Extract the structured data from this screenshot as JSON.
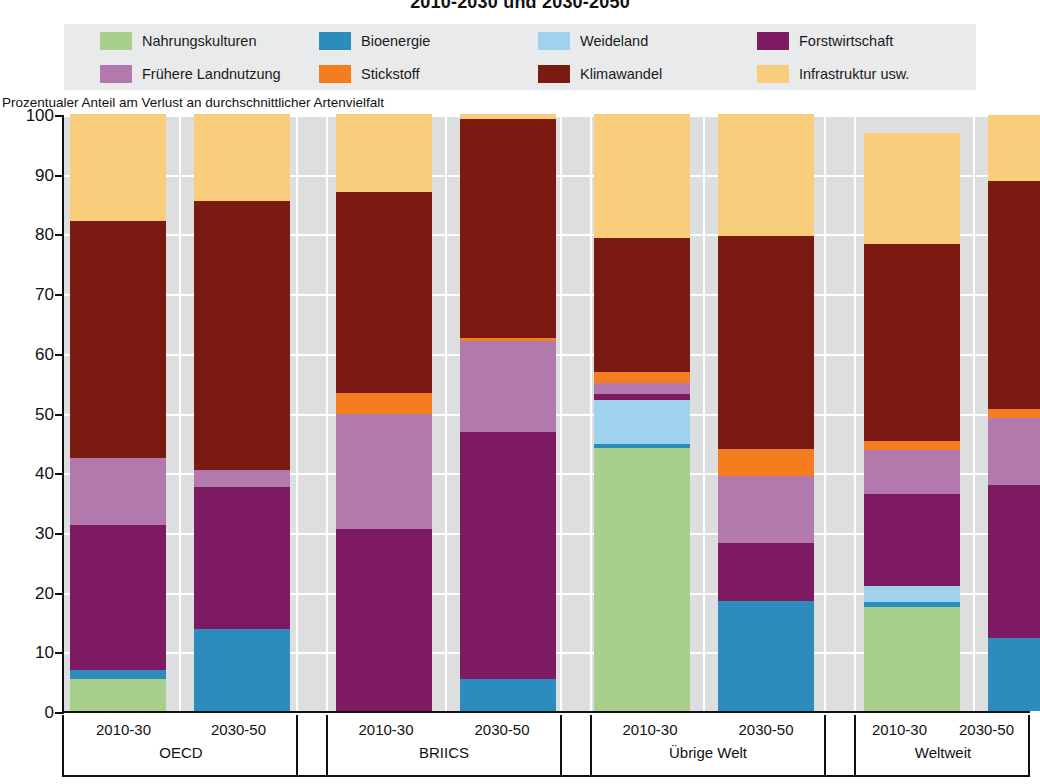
{
  "title": "2010-2030 und 2030-2050",
  "axis_caption": "Prozentualer Anteil am Verlust an durchschnittlicher Artenvielfalt",
  "legend": {
    "items": [
      {
        "label": "Nahrungskulturen",
        "color": "#a9cf8c"
      },
      {
        "label": "Bioenergie",
        "color": "#2b8cbd"
      },
      {
        "label": "Weideland",
        "color": "#9ed2ed"
      },
      {
        "label": "Forstwirtschaft",
        "color": "#7d1a62"
      },
      {
        "label": "Frühere Landnutzung",
        "color": "#b279ac"
      },
      {
        "label": "Stickstoff",
        "color": "#f47d20"
      },
      {
        "label": "Klimawandel",
        "color": "#7b1a11"
      },
      {
        "label": "Infrastruktur usw.",
        "color": "#f8ce7c"
      }
    ]
  },
  "chart_data": {
    "type": "bar",
    "stacked": true,
    "title": "2010-2030 und 2030-2050",
    "xlabel": "",
    "ylabel": "Prozentualer Anteil am Verlust an durchschnittlicher Artenvielfalt",
    "ylim": [
      0,
      100
    ],
    "yticks": [
      0,
      10,
      20,
      30,
      40,
      50,
      60,
      70,
      80,
      90,
      100
    ],
    "grid": true,
    "legend_position": "top",
    "groups": [
      "OECD",
      "BRIICS",
      "Übrige Welt",
      "Weltweit"
    ],
    "periods": [
      "2010-30",
      "2030-50"
    ],
    "categories": [
      "OECD 2010-30",
      "OECD 2030-50",
      "BRIICS 2010-30",
      "BRIICS 2030-50",
      "Übrige Welt 2010-30",
      "Übrige Welt 2030-50",
      "Weltweit 2010-30",
      "Weltweit 2030-50"
    ],
    "series": [
      {
        "name": "Nahrungskulturen",
        "color": "#a9cf8c",
        "values": [
          5.3,
          0.0,
          0.0,
          0.0,
          44.0,
          0.0,
          17.5,
          0.0
        ]
      },
      {
        "name": "Bioenergie",
        "color": "#2b8cbd",
        "values": [
          1.5,
          13.7,
          0.0,
          5.3,
          0.8,
          18.5,
          0.8,
          12.3
        ]
      },
      {
        "name": "Weideland",
        "color": "#9ed2ed",
        "values": [
          0.0,
          0.0,
          0.0,
          0.0,
          7.3,
          0.0,
          2.7,
          0.0
        ]
      },
      {
        "name": "Forstwirtschaft",
        "color": "#7d1a62",
        "values": [
          24.4,
          23.8,
          30.5,
          41.5,
          1.0,
          9.6,
          15.3,
          25.6
        ]
      },
      {
        "name": "Frühere Landnutzung",
        "color": "#b279ac",
        "values": [
          11.1,
          2.8,
          19.2,
          15.1,
          1.8,
          11.2,
          7.4,
          11.2
        ]
      },
      {
        "name": "Stickstoff",
        "color": "#f47d20",
        "values": [
          0.0,
          0.0,
          3.5,
          0.5,
          1.9,
          4.6,
          1.6,
          1.5
        ]
      },
      {
        "name": "Klimawandel",
        "color": "#7b1a11",
        "values": [
          39.7,
          45.1,
          33.8,
          36.8,
          22.5,
          35.6,
          32.9,
          38.2
        ]
      },
      {
        "name": "Infrastruktur usw.",
        "color": "#f8ce7c",
        "values": [
          18.0,
          14.6,
          13.0,
          0.8,
          20.7,
          20.5,
          18.6,
          11.0
        ]
      }
    ]
  }
}
